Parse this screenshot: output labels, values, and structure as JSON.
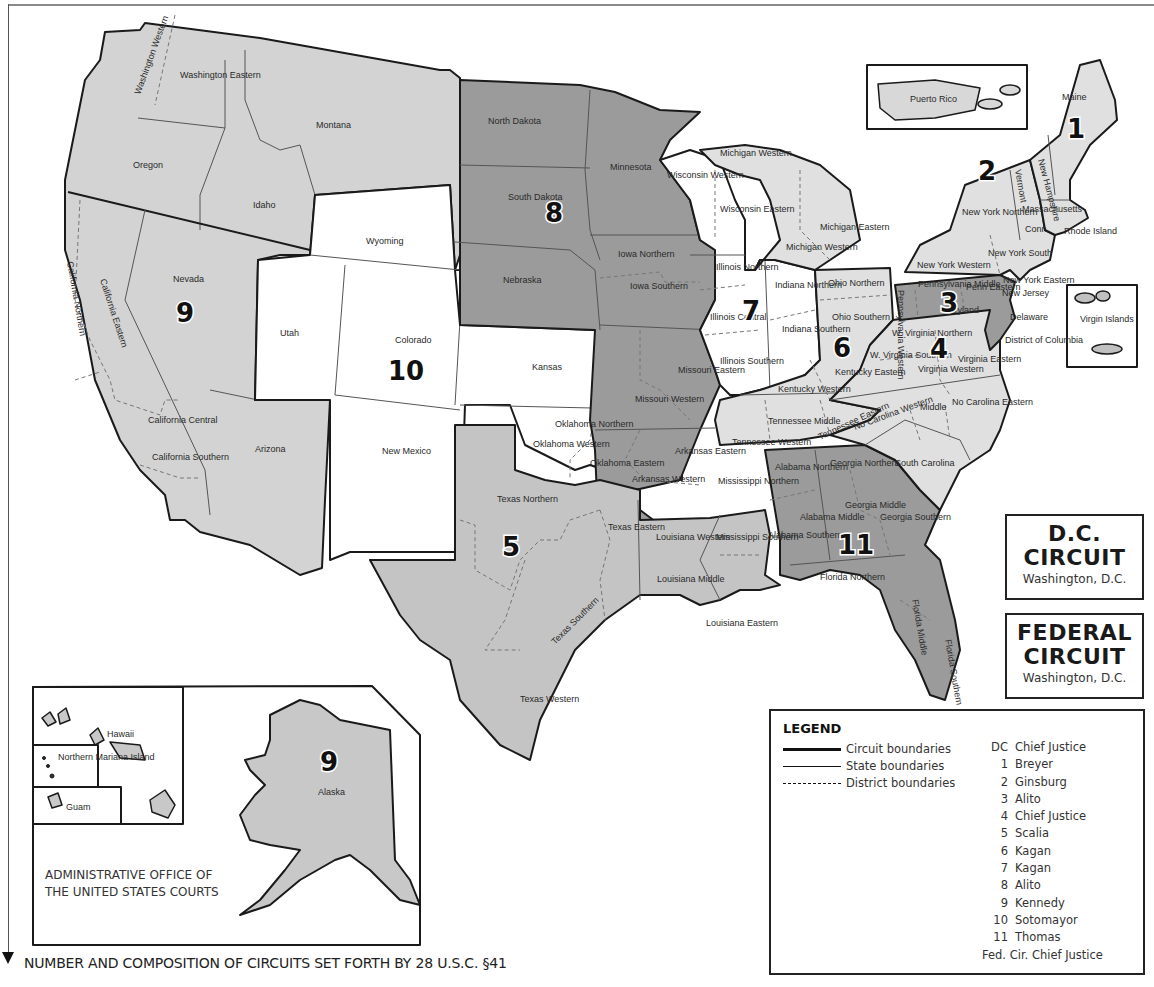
{
  "map": {
    "title_note": "NUMBER AND COMPOSITION OF CIRCUITS SET FORTH BY 28 U.S.C. §41",
    "publisher": [
      "ADMINISTRATIVE OFFICE OF",
      "THE UNITED STATES COURTS"
    ],
    "colors": {
      "circuit_light": "#dedede",
      "circuit_mid": "#c4c4c4",
      "circuit_dark": "#9a9a9a",
      "circuit_white": "#ffffff",
      "border": "#1a1a1a"
    },
    "circuit_numbers": {
      "c1": "1",
      "c2": "2",
      "c3": "3",
      "c4": "4",
      "c5": "5",
      "c6": "6",
      "c7": "7",
      "c8": "8",
      "c9": "9",
      "c9_alaska": "9",
      "c10": "10",
      "c11": "11"
    },
    "districts": {
      "wa_w": "Washington Western",
      "wa_e": "Washington Eastern",
      "montana": "Montana",
      "oregon": "Oregon",
      "idaho": "Idaho",
      "nevada": "Nevada",
      "ca_n": "California Northern",
      "ca_e": "California Eastern",
      "ca_c": "California Central",
      "ca_s": "California Southern",
      "arizona": "Arizona",
      "wyoming": "Wyoming",
      "utah": "Utah",
      "colorado": "Colorado",
      "kansas": "Kansas",
      "new_mexico": "New Mexico",
      "ok_n": "Oklahoma Northern",
      "ok_w": "Oklahoma Western",
      "ok_e": "Oklahoma Eastern",
      "nd": "North Dakota",
      "sd": "South Dakota",
      "nebraska": "Nebraska",
      "minnesota": "Minnesota",
      "ia_n": "Iowa Northern",
      "ia_s": "Iowa Southern",
      "mo_e": "Missouri Eastern",
      "mo_w": "Missouri Western",
      "ar_e": "Arkansas Eastern",
      "ar_w": "Arkansas Western",
      "tx_n": "Texas Northern",
      "tx_e": "Texas Eastern",
      "tx_s": "Texas Southern",
      "tx_w": "Texas Western",
      "la_w": "Louisiana Western",
      "la_m": "Louisiana Middle",
      "la_e": "Louisiana Eastern",
      "ms_n": "Mississippi Northern",
      "ms_s": "Mississippi Southern",
      "wi_w": "Wisconsin Western",
      "wi_e": "Wisconsin Eastern",
      "il_n": "Illinois Northern",
      "il_c": "Illinois Central",
      "il_s": "Illinois Southern",
      "in_n": "Indiana Northern",
      "in_s": "Indiana Southern",
      "mi_w": "Michigan Western",
      "mi_e": "Michigan Eastern",
      "oh_n": "Ohio Northern",
      "oh_s": "Ohio Southern",
      "ky_e": "Kentucky Eastern",
      "ky_w": "Kentucky Western",
      "tn_w": "Tennessee Western",
      "tn_m": "Tennessee Middle",
      "tn_e": "Tennessee Eastern",
      "nc_w": "No Carolina Western",
      "nc_m": "Middle",
      "nc_e": "No Carolina Eastern",
      "sc": "South Carolina",
      "va_e": "Virginia Eastern",
      "va_w": "Virginia Western",
      "wv_n": "W. Virginia Northern",
      "wv_s": "W. Virginia Southern",
      "maryland": "Maryland",
      "dc": "District of Columbia",
      "delaware": "Delaware",
      "new_jersey": "New Jersey",
      "pa_w": "Pennsylvania Western",
      "pa_m": "Pennsylvania Middle",
      "pa_e": "Penn Eastern",
      "ny_w": "New York Western",
      "ny_n": "New York Northern",
      "ny_s": "New York South",
      "ny_e": "New York Eastern",
      "vermont": "Vermont",
      "conn": "Conn.",
      "mass": "Massachusetts",
      "ri": "Rhode Island",
      "nh": "New Hampshire",
      "maine": "Maine",
      "puerto_rico": "Puerto Rico",
      "virgin_islands": "Virgin Islands",
      "al_n": "Alabama Northern",
      "al_m": "Alabama Middle",
      "al_s": "Alabama Southern",
      "ga_n": "Georgia Northern",
      "ga_m": "Georgia Middle",
      "ga_s": "Georgia Southern",
      "fl_n": "Florida Northern",
      "fl_m": "Florida Middle",
      "fl_s": "Florida Southern",
      "alaska": "Alaska",
      "hawaii": "Hawaii",
      "nmi": "Northern Mariana Island",
      "guam": "Guam"
    }
  },
  "special_circuits": [
    {
      "name_line1": "D.C.",
      "name_line2": "CIRCUIT",
      "location": "Washington, D.C."
    },
    {
      "name_line1": "FEDERAL",
      "name_line2": "CIRCUIT",
      "location": "Washington, D.C."
    }
  ],
  "legend": {
    "title": "LEGEND",
    "lines": [
      {
        "label": "Circuit boundaries",
        "style": "thick"
      },
      {
        "label": "State boundaries",
        "style": "thin"
      },
      {
        "label": "District boundaries",
        "style": "dashed"
      }
    ],
    "justices": [
      {
        "circuit": "DC",
        "justice": "Chief Justice"
      },
      {
        "circuit": "1",
        "justice": "Breyer"
      },
      {
        "circuit": "2",
        "justice": "Ginsburg"
      },
      {
        "circuit": "3",
        "justice": "Alito"
      },
      {
        "circuit": "4",
        "justice": "Chief Justice"
      },
      {
        "circuit": "5",
        "justice": "Scalia"
      },
      {
        "circuit": "6",
        "justice": "Kagan"
      },
      {
        "circuit": "7",
        "justice": "Kagan"
      },
      {
        "circuit": "8",
        "justice": "Alito"
      },
      {
        "circuit": "9",
        "justice": "Kennedy"
      },
      {
        "circuit": "10",
        "justice": "Sotomayor"
      },
      {
        "circuit": "11",
        "justice": "Thomas"
      },
      {
        "circuit": "",
        "justice": "Fed. Cir. Chief Justice"
      }
    ]
  }
}
